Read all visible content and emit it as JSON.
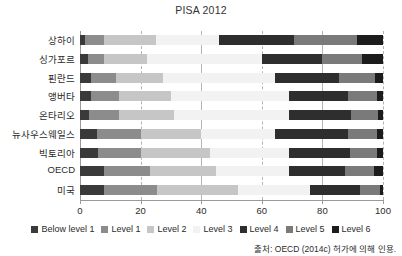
{
  "chart_data": {
    "type": "bar",
    "subtype": "stacked-horizontal-100pct",
    "title": "PISA 2012",
    "xlabel": "",
    "ylabel": "",
    "xlim": [
      0,
      100
    ],
    "xticks": [
      0,
      20,
      40,
      60,
      80,
      100
    ],
    "grid": "vertical-dashed",
    "legend_position": "bottom-center",
    "categories": [
      "상하이",
      "싱가포르",
      "핀란드",
      "앵버타",
      "온타리오",
      "뉴사우스웨일스",
      "빅토리아",
      "OECD",
      "미국"
    ],
    "series": [
      {
        "name": "Below level 1",
        "color": "#3a3a3a",
        "values": [
          1.5,
          2.5,
          3.5,
          3.5,
          3.0,
          5.5,
          6.0,
          8.0,
          8.0
        ]
      },
      {
        "name": "Level 1",
        "color": "#8c8c8c",
        "values": [
          6.5,
          5.5,
          8.5,
          9.5,
          10.0,
          14.5,
          14.0,
          15.0,
          17.5
        ]
      },
      {
        "name": "Level 2",
        "color": "#c6c6c6",
        "values": [
          17.0,
          14.0,
          15.5,
          17.0,
          18.0,
          20.0,
          23.0,
          22.0,
          26.5
        ]
      },
      {
        "name": "Level 3",
        "color": "#f2f2f2",
        "values": [
          21.0,
          38.0,
          37.0,
          39.0,
          38.0,
          24.5,
          26.0,
          24.0,
          24.0
        ]
      },
      {
        "name": "Level 4",
        "color": "#2e2e2e",
        "values": [
          24.5,
          20.0,
          21.0,
          19.5,
          20.5,
          24.0,
          20.0,
          18.5,
          16.5
        ]
      },
      {
        "name": "Level 5",
        "color": "#7a7a7a",
        "values": [
          21.0,
          13.0,
          12.0,
          9.5,
          9.0,
          9.5,
          9.0,
          9.5,
          6.5
        ]
      },
      {
        "name": "Level 6",
        "color": "#1c1c1c",
        "values": [
          8.5,
          7.0,
          2.5,
          2.0,
          1.5,
          2.0,
          2.0,
          3.0,
          1.0
        ]
      }
    ]
  },
  "legend": {
    "items": [
      {
        "label": "Below level 1"
      },
      {
        "label": "Level 1"
      },
      {
        "label": "Level 2"
      },
      {
        "label": "Level 3"
      },
      {
        "label": "Level 4"
      },
      {
        "label": "Level 5"
      },
      {
        "label": "Level 6"
      }
    ]
  },
  "source": {
    "text": "출처: OECD (2014c) 허가에 의해 인용."
  }
}
